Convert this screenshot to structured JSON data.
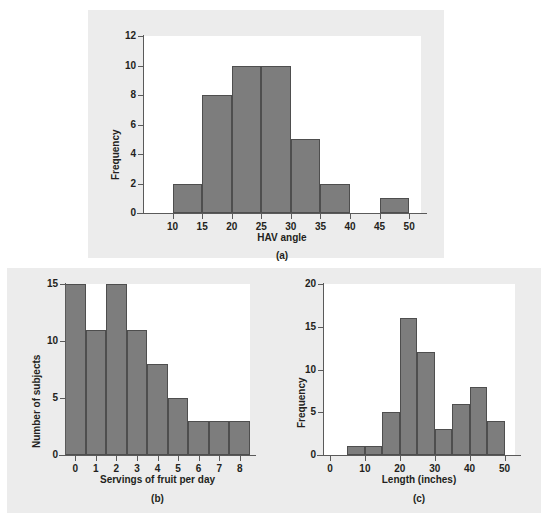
{
  "figure": {
    "background": "#ececec",
    "bar_fill": "#7d7d7d",
    "bar_stroke": "#4e4e4e",
    "plot_background": "#ffffff"
  },
  "panels": [
    {
      "caption": "(a)",
      "chart_data": {
        "type": "bar",
        "title": "",
        "subtitle": "",
        "xlabel": "HAV angle",
        "ylabel": "Frequency",
        "grid": false,
        "legend": "none",
        "xlim": [
          5,
          52
        ],
        "ylim": [
          0,
          12
        ],
        "xticks": [
          10,
          15,
          20,
          25,
          30,
          35,
          40,
          45,
          50
        ],
        "xtick_labels": [
          "10",
          "15",
          "20",
          "25",
          "30",
          "35",
          "40",
          "45",
          "50"
        ],
        "yticks": [
          0,
          2,
          4,
          6,
          8,
          10,
          12
        ],
        "ytick_labels": [
          "0",
          "2",
          "4",
          "6",
          "8",
          "10",
          "12"
        ],
        "bin_width": 5,
        "bins": [
          {
            "from": 10,
            "to": 15,
            "value": 2
          },
          {
            "from": 15,
            "to": 20,
            "value": 8
          },
          {
            "from": 20,
            "to": 25,
            "value": 10
          },
          {
            "from": 25,
            "to": 30,
            "value": 10
          },
          {
            "from": 30,
            "to": 35,
            "value": 5
          },
          {
            "from": 35,
            "to": 40,
            "value": 2
          },
          {
            "from": 45,
            "to": 50,
            "value": 1
          }
        ],
        "categories": [
          "10-15",
          "15-20",
          "20-25",
          "25-30",
          "30-35",
          "35-40",
          "45-50"
        ],
        "values": [
          2,
          8,
          10,
          10,
          5,
          2,
          1
        ]
      }
    },
    {
      "caption": "(b)",
      "chart_data": {
        "type": "bar",
        "title": "",
        "subtitle": "",
        "xlabel": "Servings of fruit per day",
        "ylabel": "Number of subjects",
        "grid": false,
        "legend": "none",
        "xlim": [
          -0.5,
          8.5
        ],
        "ylim": [
          0,
          15
        ],
        "xticks": [
          0,
          1,
          2,
          3,
          4,
          5,
          6,
          7,
          8
        ],
        "xtick_labels": [
          "0",
          "1",
          "2",
          "3",
          "4",
          "5",
          "6",
          "7",
          "8"
        ],
        "yticks": [
          0,
          5,
          10,
          15
        ],
        "ytick_labels": [
          "0",
          "5",
          "10",
          "15"
        ],
        "bin_width": 1,
        "bins": [
          {
            "from": -0.5,
            "to": 0.5,
            "value": 15
          },
          {
            "from": 0.5,
            "to": 1.5,
            "value": 11
          },
          {
            "from": 1.5,
            "to": 2.5,
            "value": 15
          },
          {
            "from": 2.5,
            "to": 3.5,
            "value": 11
          },
          {
            "from": 3.5,
            "to": 4.5,
            "value": 8
          },
          {
            "from": 4.5,
            "to": 5.5,
            "value": 5
          },
          {
            "from": 5.5,
            "to": 6.5,
            "value": 3
          },
          {
            "from": 6.5,
            "to": 7.5,
            "value": 3
          },
          {
            "from": 7.5,
            "to": 8.5,
            "value": 3
          }
        ],
        "categories": [
          "0",
          "1",
          "2",
          "3",
          "4",
          "5",
          "6",
          "7",
          "8"
        ],
        "values": [
          15,
          11,
          15,
          11,
          8,
          5,
          3,
          3,
          3
        ]
      }
    },
    {
      "caption": "(c)",
      "chart_data": {
        "type": "bar",
        "title": "",
        "subtitle": "",
        "xlabel": "Length (inches)",
        "ylabel": "Frequency",
        "grid": false,
        "legend": "none",
        "xlim": [
          -2,
          53
        ],
        "ylim": [
          0,
          20
        ],
        "xticks": [
          0,
          10,
          20,
          30,
          40,
          50
        ],
        "xtick_labels": [
          "0",
          "10",
          "20",
          "30",
          "40",
          "50"
        ],
        "yticks": [
          0,
          5,
          10,
          15,
          20
        ],
        "ytick_labels": [
          "0",
          "5",
          "10",
          "15",
          "20"
        ],
        "bin_width": 5,
        "bins": [
          {
            "from": 5,
            "to": 10,
            "value": 1
          },
          {
            "from": 10,
            "to": 15,
            "value": 1
          },
          {
            "from": 15,
            "to": 20,
            "value": 5
          },
          {
            "from": 20,
            "to": 25,
            "value": 16
          },
          {
            "from": 25,
            "to": 30,
            "value": 12
          },
          {
            "from": 30,
            "to": 35,
            "value": 3
          },
          {
            "from": 35,
            "to": 40,
            "value": 6
          },
          {
            "from": 40,
            "to": 45,
            "value": 8
          },
          {
            "from": 45,
            "to": 50,
            "value": 4
          }
        ],
        "categories": [
          "5-10",
          "10-15",
          "15-20",
          "20-25",
          "25-30",
          "30-35",
          "35-40",
          "40-45",
          "45-50"
        ],
        "values": [
          1,
          1,
          5,
          16,
          12,
          3,
          6,
          8,
          4
        ]
      }
    }
  ]
}
